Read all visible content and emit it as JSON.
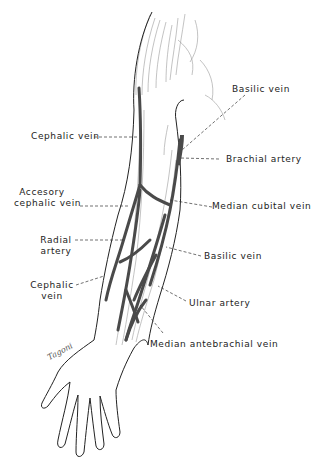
{
  "figure": {
    "signature": "Tagoni",
    "colors": {
      "ink": "#222222",
      "vein_fill": "#4a4a4a",
      "shading": "#9a9a9a",
      "background": "#ffffff"
    }
  },
  "labels": {
    "basilic_vein_upper": "Basilic vein",
    "cephalic_vein_upper": "Cephalic vein",
    "brachial_artery": "Brachial artery",
    "accessory_cephalic_vein_line1": "Accesory",
    "accessory_cephalic_vein_line2": "cephalic vein",
    "median_cubital_vein": "Median cubital vein",
    "radial_artery_line1": "Radial",
    "radial_artery_line2": "artery",
    "basilic_vein_lower": "Basilic vein",
    "cephalic_vein_lower_line1": "Cephalic",
    "cephalic_vein_lower_line2": "vein",
    "ulnar_artery": "Ulnar artery",
    "median_antebrachial_vein": "Median antebrachial vein"
  }
}
